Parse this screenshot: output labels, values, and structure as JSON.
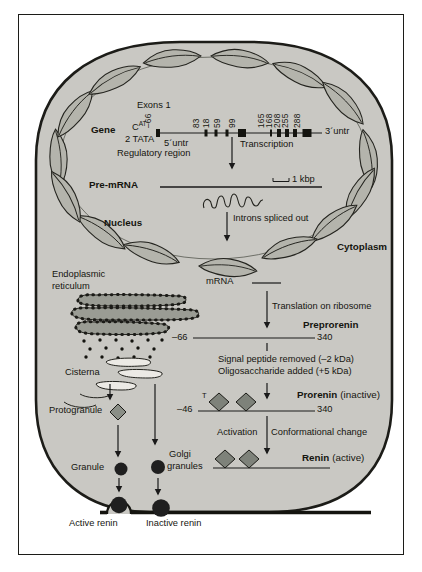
{
  "palette": {
    "cell_fill": "#c9c8c3",
    "chromosome_fill": "#b4b4ac",
    "er_fill": "#9a9c94",
    "diamond_fill": "#7e827a",
    "granule_fill": "#1f1f1f",
    "line_color": "#1a1a1a"
  },
  "cell": {
    "nucleus_label": "Nucleus",
    "cytoplasm_label": "Cytoplasm"
  },
  "gene": {
    "label": "Gene",
    "exons_label": "Exons 1",
    "cat_base": "C",
    "cat_sup": "AT",
    "tata_label": "2 TATA",
    "regulatory_label": "Regulatory region",
    "five_untr": "5´untr",
    "three_untr": "3´untr",
    "exon_numbers": [
      "–66",
      "83",
      "18",
      "59",
      "99",
      "165",
      "168",
      "208",
      "255",
      "288"
    ],
    "transcription_label": "Transcription"
  },
  "premrna": {
    "label": "Pre-mRNA",
    "scale_label": "1 kbp"
  },
  "splicing": {
    "label": "Introns spliced out"
  },
  "mrna": {
    "label": "mRNA",
    "translation_label": "Translation on ribosome"
  },
  "preprorenin": {
    "label": "Preprorenin",
    "start": "–66",
    "end": "340"
  },
  "processing": {
    "line1": "Signal peptide removed (–2 kDa)",
    "line2": "Oligosaccharide added (+5 kDa)"
  },
  "prorenin": {
    "label": "Prorenin",
    "state": "(inactive)",
    "start": "–46",
    "end": "340",
    "t_mark": "T"
  },
  "activation": {
    "left": "Activation",
    "right": "Conformational change"
  },
  "renin": {
    "label": "Renin",
    "state": "(active)"
  },
  "er": {
    "label_line1": "Endoplasmic",
    "label_line2": "reticulum"
  },
  "cisterna": {
    "label": "Cisterna"
  },
  "granules": {
    "protogranule": "Protogranule",
    "granule": "Granule",
    "golgi_line1": "Golgi",
    "golgi_line2": "granules"
  },
  "secretion": {
    "active": "Active renin",
    "inactive": "Inactive renin"
  }
}
